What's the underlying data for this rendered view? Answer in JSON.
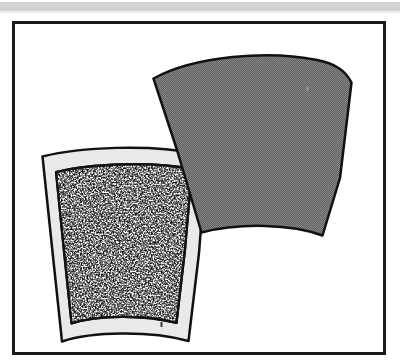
{
  "figure": {
    "domain": "natural-image-illustration",
    "description": "Line-art illustration of two overlapping curved fan-shaped plate fragments inside a rectangular frame",
    "frame": {
      "name": "figure-border",
      "x": 12,
      "y": 21,
      "width": 374,
      "height": 334,
      "border_width": 3,
      "border_color": "#1b1b1b",
      "fill_color": "#ffffff"
    },
    "top_band": {
      "name": "page-header-band",
      "x": 0,
      "y": 2,
      "width": 400,
      "height": 9,
      "color": "#d2d2d2",
      "shadow_color": "#ececec"
    },
    "shapes": [
      {
        "name": "dark-fan-fragment",
        "label": "Upper right fan-shaped fragment",
        "fill": "#6e6e6e",
        "fill_style": "dithered-halftone",
        "outline": "#111111",
        "outline_width": 2.5,
        "z_order": 2,
        "path": "M 153.5 78.5 C 195 56 268 50 317 60 C 334 63.5 345 69.5 351.5 82.5 L 340 178 L 322.5 235.5 C 292 224 240 222.5 201.5 232.5 L 177 150 Z"
      },
      {
        "name": "speckled-fan-fragment",
        "label": "Lower left fan-shaped fragment with speckled interior",
        "band_fill": "#e9e9e9",
        "interior_fill": "#ffffff",
        "interior_texture": "black-speckle-noise",
        "outline": "#111111",
        "outline_width": 2.5,
        "z_order": 1,
        "outer_path": "M 42.5 156.5 C 80 147 150 144 196.5 153.5 C 201 154.5 204 155.5 206.5 157 L 199 253 L 188.5 341 C 150 330.5 92 331.5 62 341.5 L 52 247 Z",
        "inner_path": "M 56 172 C 90 163.5 152 161 192 169 L 185 250 L 176.5 323 C 144 314.5 97 315 71.5 323.5 L 63.5 247 Z"
      }
    ],
    "artifacts": [
      {
        "name": "speck-mark-lower",
        "x": 161,
        "y": 323,
        "width": 2,
        "height": 5,
        "color": "#3a3a3a"
      },
      {
        "name": "speck-mark-upper",
        "x": 307,
        "y": 88,
        "width": 2,
        "height": 4,
        "color": "#9a9a9a"
      }
    ]
  }
}
